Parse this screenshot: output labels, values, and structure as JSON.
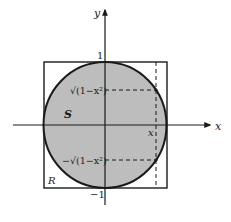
{
  "diagram": {
    "axes": {
      "x_label": "x",
      "y_label": "y"
    },
    "ticks": {
      "y_top": "1",
      "y_bottom": "−1"
    },
    "regions": {
      "circle_label": "S",
      "square_label": "R"
    },
    "markers": {
      "x_value_label": "x",
      "upper_value_label": "√(1−x²)",
      "lower_value_label": "−√(1−x²)"
    },
    "colors": {
      "circle_fill": "#bdbdbd",
      "stroke": "#1a1a1a",
      "background": "#ffffff"
    }
  }
}
